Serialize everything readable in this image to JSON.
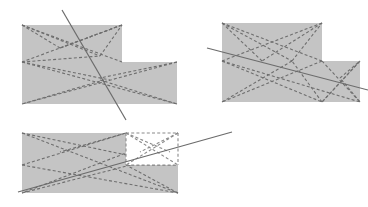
{
  "figure": {
    "title": "",
    "canvas": {
      "width": 368,
      "height": 207,
      "background": "#ffffff"
    },
    "style": {
      "polygon_fill": "#c4c4c4",
      "polygon_fill_alt": "#c6c6c6",
      "dashed_stroke": "#6e6e6e",
      "dashed_width": 1.1,
      "dashed_pattern": "3,2.2",
      "solid_stroke": "#6b6b6b",
      "solid_width": 1.2,
      "notch_fill": "#ffffff",
      "notch_dashed_stroke": "#8a8a8a"
    },
    "panels": [
      {
        "id": "panel-1",
        "label": "upper-left-l-shape",
        "outline": "22,25 122,25 122,62 177,62 177,104 22,104",
        "dashed_edges": [
          "22,25 122,62",
          "122,25 22,62",
          "22,25 100,56",
          "122,25 60,48",
          "22,62 177,104",
          "177,62 22,104",
          "22,62 110,80",
          "177,62 100,78",
          "22,104 104,80",
          "177,104 100,80",
          "22,25 60,48",
          "60,48 122,25",
          "22,62 100,56",
          "100,56 122,25"
        ],
        "solid_cut": "62,10 126,120"
      },
      {
        "id": "panel-2",
        "label": "upper-right-l-shape",
        "outline": "222,23 322,23 322,61 360,61 360,102 222,102",
        "dashed_edges": [
          "222,23 292,61",
          "322,23 222,61",
          "222,23 322,61",
          "322,23 262,61",
          "222,61 322,102",
          "322,61 222,102",
          "222,61 360,102",
          "360,61 322,102",
          "322,61 360,102",
          "322,102 360,61",
          "292,61 322,23",
          "262,61 222,23",
          "222,102 292,61",
          "322,102 292,61",
          "360,102 340,78",
          "340,78 360,61"
        ],
        "solid_cut": "207,48 368,90"
      },
      {
        "id": "panel-3",
        "label": "lower-left-notched-rectangle",
        "outline": "22,133 178,133 178,193 22,193",
        "notch": {
          "x": 126,
          "y": 133,
          "width": 52,
          "height": 32
        },
        "dashed_edges": [
          "22,133 178,193",
          "178,133 22,193",
          "22,133 150,160",
          "126,133 60,152",
          "22,165 126,133",
          "22,193 150,160",
          "178,193 126,165",
          "126,165 178,133",
          "126,133 178,165",
          "126,165 178,165",
          "150,160 178,150",
          "22,165 178,193"
        ],
        "notch_dashed_edges": [
          "126,133 178,165",
          "178,133 126,165",
          "126,133 170,152",
          "178,133 140,152",
          "126,165 178,165",
          "126,133 126,165",
          "178,133 178,165",
          "126,133 178,133"
        ],
        "solid_cut": "18,192 232,132"
      }
    ]
  }
}
